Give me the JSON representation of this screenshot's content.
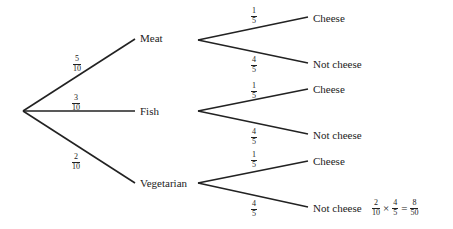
{
  "colors": {
    "line": "#222222",
    "text": "#222222",
    "background": "#ffffff"
  },
  "first_level": [
    {
      "label": "Meat",
      "prob_num": "5",
      "prob_den": "10"
    },
    {
      "label": "Fish",
      "prob_num": "3",
      "prob_den": "10"
    },
    {
      "label": "Vegetarian",
      "prob_num": "2",
      "prob_den": "10"
    }
  ],
  "second_level": [
    {
      "parent": "Meat",
      "branches": [
        {
          "label": "Cheese",
          "prob_num": "1",
          "prob_den": "5"
        },
        {
          "label": "Not cheese",
          "prob_num": "4",
          "prob_den": "5"
        }
      ]
    },
    {
      "parent": "Fish",
      "branches": [
        {
          "label": "Cheese",
          "prob_num": "1",
          "prob_den": "5"
        },
        {
          "label": "Not cheese",
          "prob_num": "4",
          "prob_den": "5"
        }
      ]
    },
    {
      "parent": "Vegetarian",
      "branches": [
        {
          "label": "Cheese",
          "prob_num": "1",
          "prob_den": "5"
        },
        {
          "label": "Not cheese",
          "prob_num": "4",
          "prob_den": "5"
        }
      ]
    }
  ],
  "calculation": {
    "a_num": "2",
    "a_den": "10",
    "times": "×",
    "b_num": "4",
    "b_den": "5",
    "equals": "=",
    "r_num": "8",
    "r_den": "50"
  }
}
